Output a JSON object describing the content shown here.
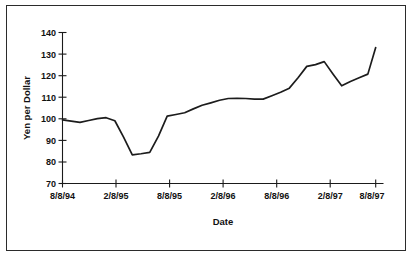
{
  "chart_data": {
    "type": "line",
    "title": "",
    "xlabel": "Date",
    "ylabel": "Yen per Dollar",
    "ylim": [
      70,
      140
    ],
    "ytick_values": [
      70,
      80,
      90,
      100,
      110,
      120,
      130,
      140
    ],
    "ytick_labels": [
      "70",
      "80",
      "90",
      "100",
      "110",
      "120",
      "130",
      "140"
    ],
    "xtick_labels": [
      "8/8/94",
      "2/8/95",
      "8/8/95",
      "2/8/96",
      "8/8/96",
      "2/8/97",
      "8/8/97",
      "1/5/98"
    ],
    "xtick_positions": [
      0,
      6,
      12,
      18,
      24,
      30,
      35.9
    ],
    "grid": false,
    "legend": null,
    "series": [
      {
        "name": "Yen per Dollar",
        "x": [
          0,
          1,
          2,
          3,
          4,
          5,
          6,
          7,
          8,
          9,
          10,
          11,
          12,
          13,
          14,
          15,
          16,
          17,
          18,
          19,
          20,
          21,
          22,
          23,
          24,
          25,
          26,
          27,
          28,
          29,
          30,
          31,
          32,
          33,
          34,
          35,
          35.9
        ],
        "x_labels": [
          "8/8/94",
          "9/8/94",
          "10/8/94",
          "11/8/94",
          "12/8/94",
          "1/8/95",
          "2/8/95",
          "3/8/95",
          "4/8/95",
          "5/8/95",
          "6/8/95",
          "7/8/95",
          "8/8/95",
          "9/8/95",
          "10/8/95",
          "11/8/95",
          "12/8/95",
          "1/8/96",
          "2/8/96",
          "3/8/96",
          "4/8/96",
          "5/8/96",
          "6/8/96",
          "7/8/96",
          "8/8/96",
          "9/8/96",
          "10/8/96",
          "11/8/96",
          "12/8/96",
          "1/8/97",
          "2/8/97",
          "3/8/97",
          "4/8/97",
          "5/8/97",
          "6/8/97",
          "8/8/97",
          "1/5/98"
        ],
        "values": [
          99.5,
          98.9,
          98.3,
          99.2,
          100.1,
          100.5,
          99.1,
          91.5,
          83.3,
          83.8,
          84.4,
          92.0,
          101.2,
          102.0,
          102.8,
          104.6,
          106.3,
          107.4,
          108.6,
          109.4,
          109.5,
          109.4,
          109.1,
          109.1,
          110.7,
          112.3,
          114.2,
          119.0,
          124.3,
          125.1,
          126.5,
          120.8,
          115.3,
          117.3,
          119.0,
          120.7,
          133.0
        ]
      }
    ]
  },
  "axis": {
    "x_title": "Date",
    "y_title": "Yen per Dollar"
  }
}
